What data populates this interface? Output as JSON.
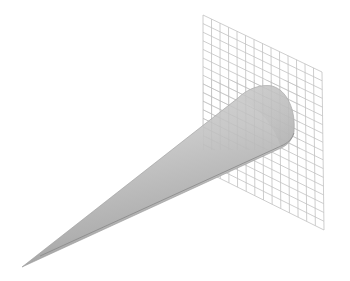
{
  "figure": {
    "background_color": "#ffffff",
    "cone": {
      "apex": [
        22,
        267
      ],
      "base_center": [
        272,
        118
      ],
      "fill_light": "#e6e6e6",
      "fill_mid": "#c4c4c4",
      "fill_dark": "#9a9a9a",
      "edge_color": "#7a7a7a"
    },
    "grid_plane": {
      "corners": [
        [
          203,
          15
        ],
        [
          322,
          72
        ],
        [
          324,
          230
        ],
        [
          203,
          170
        ]
      ],
      "rows": 18,
      "cols": 14,
      "line_color": "#b8b8b8"
    }
  }
}
